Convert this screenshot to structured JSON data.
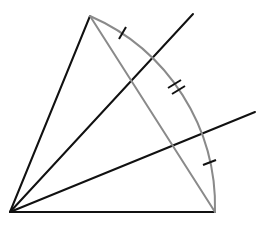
{
  "diagram": {
    "type": "geometric-construction",
    "colors": {
      "lines": "#111111",
      "arc_and_chord": "#8a8a8a",
      "background": "#ffffff"
    },
    "points": {
      "origin": [
        10,
        212
      ],
      "top_vertex": [
        90,
        16
      ],
      "bottom_right_vertex": [
        215,
        212
      ],
      "upper_ray_end": [
        193,
        14
      ],
      "right_ray_end": [
        255,
        112
      ]
    },
    "tick_marks": [
      {
        "position": "arc-upper",
        "count": 1
      },
      {
        "position": "arc-middle",
        "count": 2
      },
      {
        "position": "arc-lower",
        "count": 1
      }
    ]
  }
}
